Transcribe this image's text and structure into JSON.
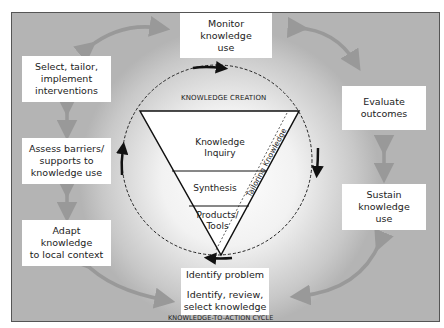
{
  "diagram": {
    "center": {
      "title": "KNOWLEDGE CREATION",
      "layers": [
        {
          "label": "Knowledge Inquiry",
          "line1": "Knowledge",
          "line2": "Inquiry"
        },
        {
          "label": "Synthesis",
          "line1": "Synthesis"
        },
        {
          "label": "Products/ Tools",
          "line1": "Products/",
          "line2": "Tools"
        }
      ],
      "side_label": "Tailoring Knowledge"
    },
    "cycle_title": "KNOWLEDGE-TO-ACTION CYCLE",
    "bottom_box": {
      "top": "Identify problem",
      "bottom_line1": "Identify, review,",
      "bottom_line2": "select knowledge"
    },
    "phases": {
      "monitor": {
        "line1": "Monitor",
        "line2": "knowledge",
        "line3": "use"
      },
      "evaluate": {
        "line1": "Evaluate",
        "line2": "outcomes"
      },
      "sustain": {
        "line1": "Sustain",
        "line2": "knowledge",
        "line3": "use"
      },
      "select": {
        "line1": "Select, tailor,",
        "line2": "implement",
        "line3": "interventions"
      },
      "assess": {
        "line1": "Assess barriers/",
        "line2": "supports to",
        "line3": "knowledge use"
      },
      "adapt": {
        "line1": "Adapt",
        "line2": "knowledge",
        "line3": "to local context"
      }
    }
  }
}
